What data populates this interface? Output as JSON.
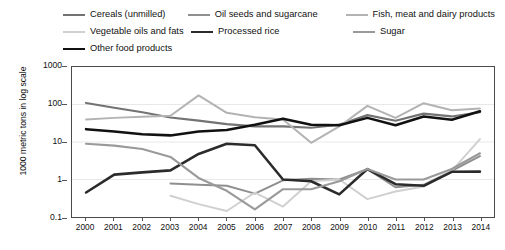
{
  "legend": {
    "rows": [
      [
        {
          "label": "Cereals (unmilled)",
          "color": "#737373",
          "width": 2.2,
          "wclass": "li-w1"
        },
        {
          "label": "Oil seeds and sugarcane",
          "color": "#8f8f8f",
          "width": 2.0,
          "wclass": "li-w2"
        },
        {
          "label": "Fish, meat and dairy products",
          "color": "#b3b3b3",
          "width": 2.0,
          "wclass": ""
        }
      ],
      [
        {
          "label": "Vegetable oils and fats",
          "color": "#d0d0d0",
          "width": 2.0,
          "wclass": "li-w1"
        },
        {
          "label": "Processed rice",
          "color": "#2b2b2b",
          "width": 2.6,
          "wclass": "li-w2"
        },
        {
          "label": "Sugar",
          "color": "#9a9a9a",
          "width": 2.2,
          "wclass": ""
        }
      ],
      [
        {
          "label": "Other food products",
          "color": "#111111",
          "width": 2.6,
          "wclass": "li-w1"
        }
      ]
    ]
  },
  "chart_data": {
    "type": "line",
    "title": "",
    "xlabel": "",
    "ylabel": "1000 metric tons in log scale",
    "yscale": "log",
    "ylim": [
      0.1,
      1000
    ],
    "yticks": [
      1000,
      100,
      10,
      1,
      0.1
    ],
    "ytick_labels": [
      "1000",
      "100",
      "10",
      "1",
      "0.1"
    ],
    "grid": true,
    "legend_position": "top",
    "x": [
      2000,
      2001,
      2002,
      2003,
      2004,
      2005,
      2006,
      2007,
      2008,
      2009,
      2010,
      2011,
      2012,
      2013,
      2014
    ],
    "categories": [
      "2000",
      "2001",
      "2002",
      "2003",
      "2004",
      "2005",
      "2006",
      "2007",
      "2008",
      "2009",
      "2010",
      "2011",
      "2012",
      "2013",
      "2014"
    ],
    "series": [
      {
        "name": "Cereals (unmilled)",
        "color": "#737373",
        "width": 2.2,
        "values": [
          110,
          82,
          62,
          45,
          37,
          30,
          26,
          26,
          24,
          29,
          52,
          37,
          57,
          48,
          62
        ]
      },
      {
        "name": "Oil seeds and sugarcane",
        "color": "#8f8f8f",
        "width": 2.0,
        "values": [
          null,
          null,
          null,
          0.78,
          0.72,
          0.68,
          0.42,
          0.95,
          1.05,
          1.0,
          1.9,
          0.62,
          0.72,
          1.7,
          4.2
        ]
      },
      {
        "name": "Fish, meat and dairy products",
        "color": "#b3b3b3",
        "width": 2.0,
        "values": [
          40,
          44,
          47,
          50,
          175,
          60,
          46,
          40,
          9.5,
          26,
          92,
          44,
          108,
          70,
          78
        ]
      },
      {
        "name": "Vegetable oils and fats",
        "color": "#d0d0d0",
        "width": 2.0,
        "values": [
          null,
          null,
          null,
          0.37,
          0.22,
          0.145,
          0.45,
          0.19,
          0.9,
          1.0,
          0.3,
          0.48,
          0.65,
          1.7,
          12
        ]
      },
      {
        "name": "Processed rice",
        "color": "#2b2b2b",
        "width": 2.6,
        "values": [
          0.45,
          1.35,
          1.55,
          1.75,
          4.8,
          9.0,
          8.2,
          1.0,
          0.9,
          0.4,
          1.9,
          0.75,
          0.68,
          1.6,
          1.62
        ]
      },
      {
        "name": "Sugar",
        "color": "#9a9a9a",
        "width": 2.2,
        "values": [
          9.0,
          8.0,
          6.5,
          4.0,
          1.1,
          0.5,
          0.16,
          0.55,
          0.55,
          0.9,
          1.9,
          1.0,
          1.0,
          1.9,
          5.0
        ]
      },
      {
        "name": "Other food products",
        "color": "#111111",
        "width": 2.6,
        "values": [
          22,
          19,
          16,
          15,
          19,
          21,
          29,
          42,
          29,
          28,
          44,
          28,
          48,
          39,
          66
        ]
      }
    ]
  }
}
